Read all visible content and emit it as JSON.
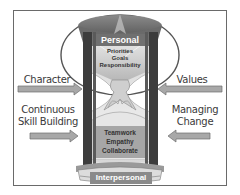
{
  "diagram": {
    "type": "hourglass",
    "top_label": "Personal",
    "bottom_label": "Interpersonal",
    "top_items": [
      "Priorities",
      "Goals",
      "Responsibility"
    ],
    "bottom_items": [
      "Teamwork",
      "Empathy",
      "Collaborate"
    ],
    "left_inputs": [
      {
        "label": "Character",
        "direction": "right"
      },
      {
        "label_line1": "Continuous",
        "label_line2": "Skill Building",
        "direction": "right"
      }
    ],
    "right_inputs": [
      {
        "label": "Values",
        "direction": "left"
      },
      {
        "label_line1": "Managing",
        "label_line2": "Change",
        "direction": "left"
      }
    ]
  },
  "colors": {
    "frame": "#6a6a6a",
    "cap": "#6e6e6e",
    "pillar": "#3c3c3c",
    "arrow": "#a8a8a8",
    "label_box": "#8a8a8a",
    "text": "#3a3a3a"
  }
}
